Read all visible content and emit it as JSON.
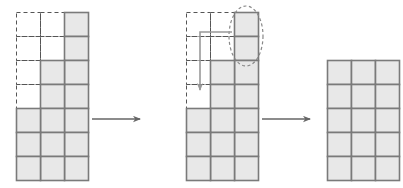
{
  "diagram": {
    "type": "transformation-sequence",
    "cell_size": {
      "w": 24,
      "h": 24
    },
    "colors": {
      "cell_fill": "#e8e8e8",
      "cell_stroke": "#7a7a7a",
      "dashed_stroke": "#555555",
      "arrow_stroke": "#666666",
      "move_arrow_stroke": "#999999",
      "ellipse_stroke": "#888888",
      "background": "#ffffff"
    },
    "panels": [
      {
        "name": "panel-initial",
        "label": "initial staircase shape",
        "origin": {
          "x": 16,
          "y": 12
        },
        "columns": 3,
        "rows": 7,
        "column_heights": [
          3,
          5,
          7
        ],
        "filled_cells": [
          [
            2,
            0
          ],
          [
            2,
            1
          ],
          [
            2,
            2
          ],
          [
            2,
            3
          ],
          [
            2,
            4
          ],
          [
            2,
            5
          ],
          [
            2,
            6
          ],
          [
            1,
            2
          ],
          [
            1,
            3
          ],
          [
            1,
            4
          ],
          [
            1,
            5
          ],
          [
            1,
            6
          ],
          [
            0,
            4
          ],
          [
            0,
            5
          ],
          [
            0,
            6
          ]
        ],
        "dashed_cells": [
          [
            0,
            0
          ],
          [
            0,
            1
          ],
          [
            0,
            2
          ],
          [
            0,
            3
          ],
          [
            1,
            0
          ],
          [
            1,
            1
          ]
        ]
      },
      {
        "name": "panel-middle",
        "label": "two top cells selected for move",
        "origin": {
          "x": 186,
          "y": 12
        },
        "columns": 3,
        "rows": 7,
        "column_heights": [
          3,
          5,
          7
        ],
        "filled_cells": [
          [
            2,
            0
          ],
          [
            2,
            1
          ],
          [
            2,
            2
          ],
          [
            2,
            3
          ],
          [
            2,
            4
          ],
          [
            2,
            5
          ],
          [
            2,
            6
          ],
          [
            1,
            2
          ],
          [
            1,
            3
          ],
          [
            1,
            4
          ],
          [
            1,
            5
          ],
          [
            1,
            6
          ],
          [
            0,
            4
          ],
          [
            0,
            5
          ],
          [
            0,
            6
          ]
        ],
        "dashed_cells": [
          [
            0,
            0
          ],
          [
            0,
            1
          ],
          [
            0,
            2
          ],
          [
            0,
            3
          ],
          [
            1,
            0
          ],
          [
            1,
            1
          ]
        ],
        "selection_ellipse": {
          "name": "selection-ellipse",
          "cx": 246,
          "cy": 36,
          "rx": 17,
          "ry": 30
        },
        "move_arrow": {
          "name": "move-arrow",
          "from_x": 232,
          "from_y": 32,
          "corner_x": 200,
          "corner_y": 32,
          "to_x": 200,
          "to_y": 90
        }
      },
      {
        "name": "panel-final",
        "label": "final 3 by 5 rectangle",
        "origin": {
          "x": 327,
          "y": 60
        },
        "columns": 3,
        "rows": 5,
        "column_heights": [
          5,
          5,
          5
        ],
        "filled_cells": [
          [
            0,
            0
          ],
          [
            1,
            0
          ],
          [
            2,
            0
          ],
          [
            0,
            1
          ],
          [
            1,
            1
          ],
          [
            2,
            1
          ],
          [
            0,
            2
          ],
          [
            1,
            2
          ],
          [
            2,
            2
          ],
          [
            0,
            3
          ],
          [
            1,
            3
          ],
          [
            2,
            3
          ],
          [
            0,
            4
          ],
          [
            1,
            4
          ],
          [
            2,
            4
          ]
        ],
        "dashed_cells": []
      }
    ],
    "flow_arrows": [
      {
        "name": "flow-arrow-1",
        "x1": 92,
        "y1": 119,
        "x2": 140,
        "y2": 119
      },
      {
        "name": "flow-arrow-2",
        "x1": 262,
        "y1": 119,
        "x2": 310,
        "y2": 119
      }
    ]
  }
}
